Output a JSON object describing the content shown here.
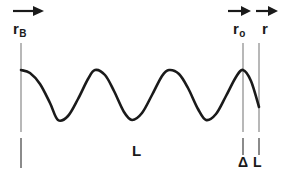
{
  "figure": {
    "type": "wave-potential-diagram",
    "background_color": "#ffffff",
    "line_color": "#1a1a1a",
    "guide_color": "#9a9a9a",
    "labels": {
      "left_marker": {
        "symbol": "r",
        "subscript": "B",
        "arrow": "right-arrow-icon"
      },
      "right_marker_inner": {
        "symbol": "r",
        "subscript": "o",
        "arrow": "right-arrow-icon"
      },
      "right_marker_outer": {
        "symbol": "r",
        "subscript": "",
        "arrow": "right-arrow-icon"
      },
      "span_length": "L",
      "span_delta": "Δ L"
    }
  },
  "chart_data": {
    "type": "line",
    "title": "",
    "xlabel": "r",
    "ylabel": "",
    "grid": false,
    "legend": null,
    "xlim": [
      21,
      259
    ],
    "ylim": [
      70,
      120
    ],
    "wavelength": 74,
    "peak_x": [
      21,
      95,
      169,
      243
    ],
    "trough_x": [
      58,
      132,
      206
    ],
    "peak_y": 70,
    "trough_y": 120,
    "series": [
      {
        "name": "wave",
        "x": [
          21,
          30,
          40,
          50,
          58,
          68,
          78,
          88,
          95,
          105,
          114,
          124,
          132,
          142,
          152,
          162,
          169,
          179,
          188,
          198,
          206,
          216,
          226,
          236,
          243,
          251,
          259
        ],
        "y": [
          70,
          73,
          84,
          103,
          120,
          116,
          99,
          79,
          70,
          75,
          91,
          112,
          120,
          113,
          95,
          76,
          70,
          74,
          88,
          109,
          120,
          114,
          96,
          77,
          70,
          81,
          107
        ]
      }
    ],
    "annotations": [
      {
        "text": "r",
        "sub": "B",
        "x": 21,
        "kind": "vertical-marker"
      },
      {
        "text": "r",
        "sub": "o",
        "x": 243,
        "kind": "vertical-marker"
      },
      {
        "text": "r",
        "sub": "",
        "x": 259,
        "kind": "vertical-marker"
      },
      {
        "text": "L",
        "x": 138,
        "y": 152,
        "kind": "span-label"
      },
      {
        "text": "Δ L",
        "x": 250,
        "y": 163,
        "kind": "span-label"
      }
    ]
  }
}
